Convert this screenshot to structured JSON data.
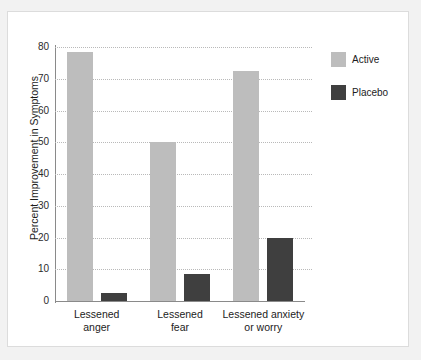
{
  "chart_data": {
    "type": "bar",
    "title": "",
    "xlabel": "",
    "ylabel": "Percent Improvement in Symptoms",
    "ylim": [
      0,
      80
    ],
    "yticks": [
      0,
      10,
      20,
      30,
      40,
      50,
      60,
      70,
      80
    ],
    "ytick_labels": [
      "0",
      "10",
      "20",
      "30",
      "40",
      "50",
      "60",
      "70",
      "80"
    ],
    "grid": true,
    "legend_position": "top-right",
    "categories": [
      "Lessened anger",
      "Lessened fear",
      "Lessened anxiety or worry"
    ],
    "category_lines": [
      [
        "Lessened",
        "anger"
      ],
      [
        "Lessened",
        "fear"
      ],
      [
        "Lessened anxiety",
        "or worry"
      ]
    ],
    "series": [
      {
        "name": "Active",
        "color": "#bdbdbd",
        "values": [
          78.5,
          50,
          72.5
        ]
      },
      {
        "name": "Placebo",
        "color": "#3f3f3f",
        "values": [
          2.5,
          8.5,
          20
        ]
      }
    ]
  },
  "legend": {
    "items": [
      {
        "label": "Active",
        "color": "#bdbdbd"
      },
      {
        "label": "Placebo",
        "color": "#3f3f3f"
      }
    ]
  }
}
